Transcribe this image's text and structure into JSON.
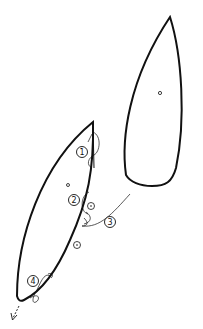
{
  "diagram": {
    "type": "sail-rigging-illustration",
    "colors": {
      "line": "#111111",
      "background": "#ffffff"
    },
    "sails": [
      {
        "name": "mainsail",
        "grommet": true
      },
      {
        "name": "jib",
        "grommet": true
      }
    ],
    "callouts": [
      {
        "number": "1",
        "x": 82,
        "y": 152
      },
      {
        "number": "2",
        "x": 74,
        "y": 200
      },
      {
        "number": "3",
        "x": 110,
        "y": 222
      },
      {
        "number": "4",
        "x": 33,
        "y": 281
      }
    ],
    "arrow": {
      "direction": "down-left",
      "style": "dashed"
    }
  }
}
